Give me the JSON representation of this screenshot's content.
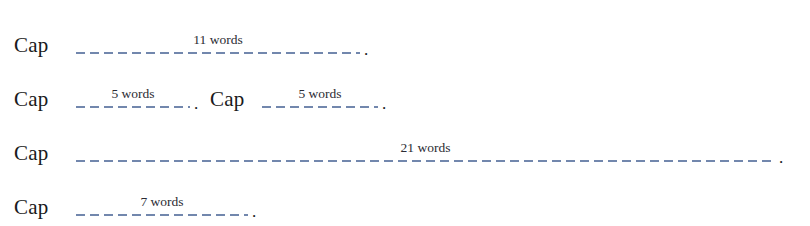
{
  "figure": {
    "background_color": "#ffffff",
    "dash_color": "#7287ad",
    "text_color": "#1a1a20",
    "rows": [
      {
        "id": "row-1",
        "top": 16,
        "segments": [
          {
            "cap_label": "Cap",
            "cap_left": 14,
            "blank_left": 76,
            "blank_width": 284,
            "count_label": "11 words",
            "period": "."
          }
        ]
      },
      {
        "id": "row-2",
        "top": 70,
        "segments": [
          {
            "cap_label": "Cap",
            "cap_left": 14,
            "blank_left": 76,
            "blank_width": 114,
            "count_label": "5 words",
            "period": "."
          },
          {
            "cap_label": "Cap",
            "cap_left": 210,
            "blank_left": 262,
            "blank_width": 116,
            "count_label": "5 words",
            "period": "."
          }
        ]
      },
      {
        "id": "row-3",
        "top": 124,
        "segments": [
          {
            "cap_label": "Cap",
            "cap_left": 14,
            "blank_left": 76,
            "blank_width": 699,
            "count_label": "21 words",
            "period": "."
          }
        ]
      },
      {
        "id": "row-4",
        "top": 178,
        "segments": [
          {
            "cap_label": "Cap",
            "cap_left": 14,
            "blank_left": 76,
            "blank_width": 172,
            "count_label": "7 words",
            "period": "."
          }
        ]
      }
    ]
  }
}
